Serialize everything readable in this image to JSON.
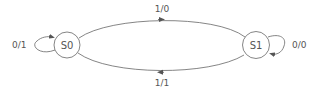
{
  "diagram": {
    "type": "finite-state-machine",
    "colors": {
      "stroke": "#666666",
      "text": "#555555",
      "background": "#ffffff"
    },
    "states": [
      {
        "id": "S0",
        "label": "S0"
      },
      {
        "id": "S1",
        "label": "S1"
      }
    ],
    "transitions": [
      {
        "from": "S0",
        "to": "S0",
        "label": "0/1"
      },
      {
        "from": "S0",
        "to": "S1",
        "label": "1/0"
      },
      {
        "from": "S1",
        "to": "S1",
        "label": "0/0"
      },
      {
        "from": "S1",
        "to": "S0",
        "label": "1/1"
      }
    ]
  }
}
